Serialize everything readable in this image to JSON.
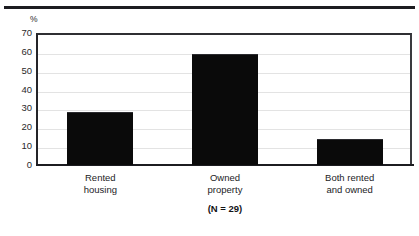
{
  "figure": {
    "unit_label": "%",
    "annotation": "(N = 29)"
  },
  "chart_data": {
    "type": "bar",
    "title": "",
    "subtitle": "",
    "xlabel": "",
    "ylabel": "%",
    "ylim": [
      0,
      70
    ],
    "ytick_step": 10,
    "yticks": [
      70,
      60,
      50,
      40,
      30,
      20,
      10,
      0
    ],
    "ytick_labels": [
      "70",
      "60",
      "50",
      "40",
      "30",
      "20",
      "10",
      "0"
    ],
    "grid": true,
    "grid_axis": "y",
    "legend": false,
    "legend_position": "none",
    "bar_color": "#0a0a0a",
    "categories": [
      "Rented housing",
      "Owned property",
      "Both rented and owned"
    ],
    "category_lines": [
      [
        "Rented",
        "housing"
      ],
      [
        "Owned",
        "property"
      ],
      [
        "Both rented",
        "and owned"
      ]
    ],
    "values": [
      28,
      59,
      14
    ],
    "value_unit": "%",
    "annotations": [
      "(N = 29)"
    ],
    "sample_size": 29
  },
  "style": {
    "background": "#ffffff",
    "axis_color": "#1c1c20",
    "grid_color": "#e3e3e3",
    "text_color": "#232326"
  }
}
